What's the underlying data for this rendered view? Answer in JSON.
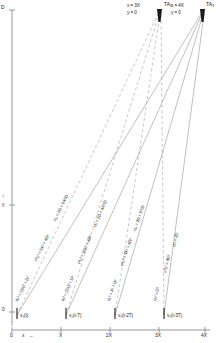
{
  "axes": {
    "y_axis_top_label": "D",
    "y_axis_mid_label": "y",
    "y_axis_mid_arrow": "↑",
    "y_axis_origin_label": "0",
    "x_axis_origin_label": "0",
    "x_axis_name": "x",
    "x_axis_arrow": "←",
    "x_ticks": [
      "0",
      "X",
      "2X",
      "3X",
      "4X"
    ]
  },
  "apexes": [
    {
      "id": "TA2",
      "label": "TA₂",
      "coord_x": "x = 3X",
      "coord_y": "y = 0"
    },
    {
      "id": "TA3",
      "label": "TA₃",
      "coord_x": "x = 4X",
      "coord_y": "y = 0"
    }
  ],
  "sources": [
    {
      "label": "v₀(t)",
      "tick": "0"
    },
    {
      "label": "v₀(t-T)",
      "tick": "X"
    },
    {
      "label": "v₀(t-2T)",
      "tick": "2X"
    },
    {
      "label": "v₀(t-3T)",
      "tick": "3X"
    }
  ],
  "ray_labels": [
    {
      "group": 1,
      "d_squared": "d₀² = (3X)² + D²",
      "c_squared": "c²t₀² = 9X² + 4D²",
      "ct": "ct₀ = 2D + 9X²/D"
    },
    {
      "group": 2,
      "d_squared": "d₁² = (2X)² + D²",
      "c_squared": "c²t₁² = 16X² + 4D²",
      "ct": "ct₁ = 2D + 4X²/D"
    },
    {
      "group": 3,
      "d_squared": "d₂² = X² + D²",
      "c_squared": "c²t₂² = 4X² + 4D²",
      "ct": "ct₂ = 2D + X²/D"
    },
    {
      "group": 4,
      "d_squared": "d₃² = D²",
      "c_squared": "c²t₃² = 4D²",
      "ct": "ct₃ = 2D"
    }
  ],
  "colors": {
    "ink": "#1a1a1a",
    "axis": "#6e6e6e",
    "solid_ray": "#8c8c8c",
    "dashed_ray": "#9a9a9a"
  }
}
